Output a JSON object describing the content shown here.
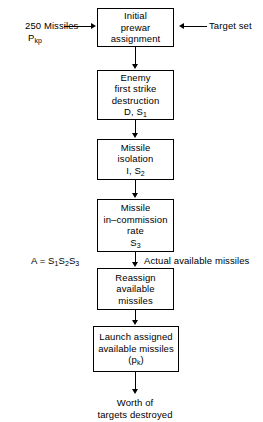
{
  "diagram": {
    "line_color": "#000000",
    "background_color": "#ffffff"
  },
  "inputs": {
    "left": {
      "line1": "250 Missiles",
      "line2_base": "P",
      "line2_sub": "kp"
    },
    "right": {
      "label": "Target set"
    }
  },
  "boxes": [
    {
      "id": "initial-prewar-assignment",
      "lines": [
        "Initial",
        "prewar",
        "assignment"
      ]
    },
    {
      "id": "enemy-first-strike-destruction",
      "lines": [
        "Enemy",
        "first strike",
        "destruction"
      ],
      "symbol_base": "D, S",
      "symbol_sub": "1"
    },
    {
      "id": "missile-isolation",
      "lines": [
        "Missile",
        "isolation"
      ],
      "symbol_base": "I, S",
      "symbol_sub": "2"
    },
    {
      "id": "missile-in-commission-rate",
      "lines": [
        "Missile",
        "in–commission",
        "rate"
      ],
      "symbol_base": "S",
      "symbol_sub": "3"
    },
    {
      "id": "reassign-available-missiles",
      "lines": [
        "Reassign",
        "available",
        "missiles"
      ]
    },
    {
      "id": "launch-assigned-available-missiles",
      "lines": [
        "Launch assigned",
        "available missiles"
      ],
      "symbol_prefix": "(p",
      "symbol_sub": "k",
      "symbol_suffix": ")"
    }
  ],
  "annotation": {
    "formula_prefix": "A = S",
    "formula_sub1": "1",
    "formula_mid1": "S",
    "formula_sub2": "2",
    "formula_mid2": "S",
    "formula_sub3": "3",
    "note": "Actual available missiles"
  },
  "output": {
    "line1": "Worth of",
    "line2": "targets destroyed"
  }
}
